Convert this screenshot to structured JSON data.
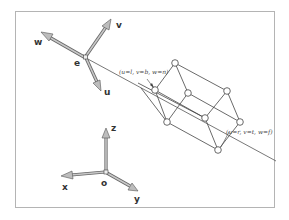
{
  "diagram": {
    "camera_frame": {
      "origin_label": "e",
      "axes": [
        {
          "name": "w",
          "label": "w"
        },
        {
          "name": "v",
          "label": "v"
        },
        {
          "name": "u",
          "label": "u"
        }
      ]
    },
    "world_frame": {
      "origin_label": "o",
      "axes": [
        {
          "name": "z",
          "label": "z"
        },
        {
          "name": "x",
          "label": "x"
        },
        {
          "name": "y",
          "label": "y"
        }
      ]
    },
    "frustum": {
      "near_corner_label": "(u=l, v=b, w=n)",
      "far_corner_label": "(u=r, v=t, w=f)"
    }
  }
}
